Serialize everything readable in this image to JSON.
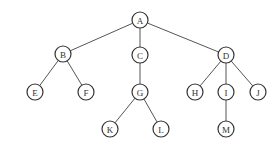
{
  "diagram": {
    "type": "tree",
    "root": "A",
    "nodes": [
      {
        "id": "A",
        "label": "A",
        "x": 140,
        "y": 20
      },
      {
        "id": "B",
        "label": "B",
        "x": 63,
        "y": 54
      },
      {
        "id": "C",
        "label": "C",
        "x": 140,
        "y": 55
      },
      {
        "id": "D",
        "label": "D",
        "x": 226,
        "y": 55
      },
      {
        "id": "E",
        "label": "E",
        "x": 35,
        "y": 92
      },
      {
        "id": "F",
        "label": "F",
        "x": 86,
        "y": 92
      },
      {
        "id": "G",
        "label": "G",
        "x": 140,
        "y": 92
      },
      {
        "id": "H",
        "label": "H",
        "x": 195,
        "y": 92
      },
      {
        "id": "I",
        "label": "I",
        "x": 226,
        "y": 92
      },
      {
        "id": "J",
        "label": "J",
        "x": 258,
        "y": 92
      },
      {
        "id": "K",
        "label": "K",
        "x": 110,
        "y": 129
      },
      {
        "id": "L",
        "label": "L",
        "x": 161,
        "y": 129
      },
      {
        "id": "M",
        "label": "M",
        "x": 226,
        "y": 129
      }
    ],
    "edges": [
      [
        "A",
        "B"
      ],
      [
        "A",
        "C"
      ],
      [
        "A",
        "D"
      ],
      [
        "B",
        "E"
      ],
      [
        "B",
        "F"
      ],
      [
        "C",
        "G"
      ],
      [
        "G",
        "K"
      ],
      [
        "G",
        "L"
      ],
      [
        "D",
        "H"
      ],
      [
        "D",
        "I"
      ],
      [
        "D",
        "J"
      ],
      [
        "I",
        "M"
      ]
    ],
    "node_radius": 8
  }
}
